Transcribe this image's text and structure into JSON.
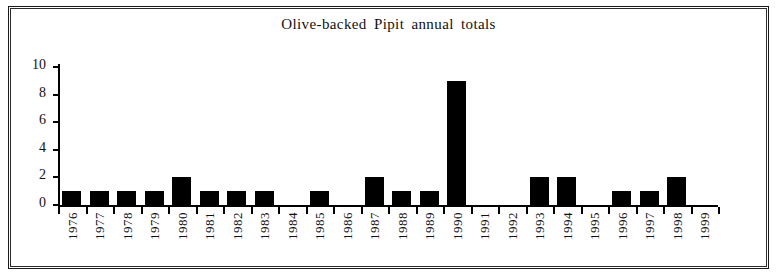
{
  "chart_data": {
    "type": "bar",
    "title": "Olive-backed Pipit annual totals",
    "xlabel": "",
    "ylabel": "",
    "ylim": [
      0,
      10
    ],
    "yticks": [
      0,
      2,
      4,
      6,
      8,
      10
    ],
    "grid": false,
    "legend": null,
    "bar_color": "#000000",
    "categories": [
      "1976",
      "1977",
      "1978",
      "1979",
      "1980",
      "1981",
      "1982",
      "1983",
      "1984",
      "1985",
      "1986",
      "1987",
      "1988",
      "1989",
      "1990",
      "1991",
      "1992",
      "1993",
      "1994",
      "1995",
      "1996",
      "1997",
      "1998",
      "1999"
    ],
    "values": [
      1,
      1,
      1,
      1,
      2,
      1,
      1,
      1,
      0,
      1,
      0,
      2,
      1,
      1,
      9,
      0,
      0,
      2,
      2,
      0,
      1,
      1,
      2,
      0
    ]
  }
}
